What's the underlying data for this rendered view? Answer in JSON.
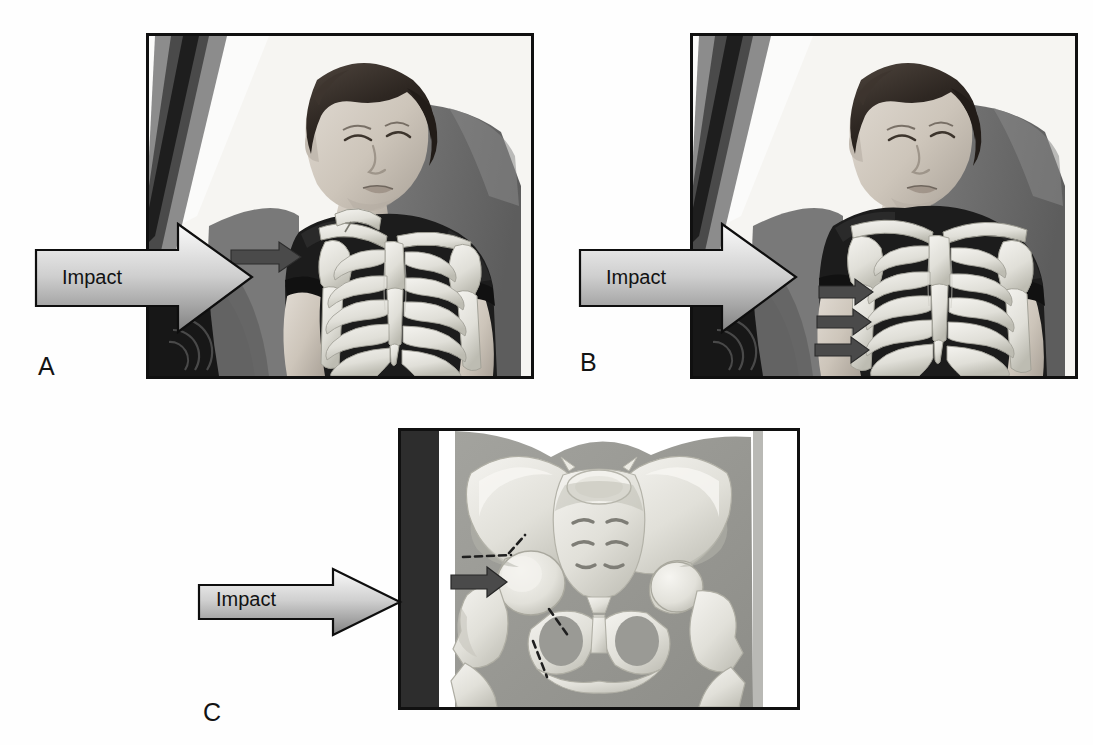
{
  "figure": {
    "background_color": "#fefefe",
    "width": 1093,
    "height": 745
  },
  "panels": [
    {
      "id": "A",
      "letter": "A",
      "letter_x": 38,
      "letter_y": 352,
      "frame": {
        "x": 146,
        "y": 33,
        "width": 388,
        "height": 346
      },
      "scene": "seated-occupant-lateral-impact-clavicle-fracture",
      "impact_label": "Impact",
      "impact_label_x": 62,
      "impact_label_y": 252,
      "arrow": {
        "x": 30,
        "y": 216,
        "width": 225,
        "height": 125
      },
      "injury_arrows": 1,
      "injury_description": "fractured-clavicle"
    },
    {
      "id": "B",
      "letter": "B",
      "letter_x": 580,
      "letter_y": 348,
      "frame": {
        "x": 690,
        "y": 33,
        "width": 388,
        "height": 346
      },
      "scene": "seated-occupant-lateral-impact-rib-fractures",
      "impact_label": "Impact",
      "impact_label_x": 606,
      "impact_label_y": 252,
      "arrow": {
        "x": 574,
        "y": 216,
        "width": 225,
        "height": 125
      },
      "injury_arrows": 3,
      "injury_description": "fractured-ribs"
    },
    {
      "id": "C",
      "letter": "C",
      "letter_x": 203,
      "letter_y": 700,
      "frame": {
        "x": 398,
        "y": 428,
        "width": 402,
        "height": 282
      },
      "scene": "pelvis-anteroposterior-lateral-impact-acetabular-femoral-neck-fracture",
      "impact_label": "Impact",
      "impact_label_x": 216,
      "impact_label_y": 588,
      "arrow": {
        "x": 195,
        "y": 565,
        "width": 207,
        "height": 72
      },
      "injury_arrows": 1,
      "injury_description": "femoral-head-driven-into-acetabulum"
    }
  ],
  "colors": {
    "frame_stroke": "#101010",
    "arrow_stroke": "#0e0e0e",
    "arrow_fill_light": "#f2f2f2",
    "arrow_fill_dark": "#8c8c8c",
    "injury_arrow_fill": "#4a4a4a",
    "bone_light": "#ededea",
    "bone_mid": "#d2d2cc",
    "bone_shadow": "#b6b6ae",
    "shirt_dark": "#1b1b1b",
    "skin_light": "#d8d2ca",
    "skin_mid": "#bdb5ab",
    "hair_dark": "#2a2522",
    "seat_gray": "#6f6f6f",
    "car_pillar": "#3a3a3a",
    "pelvis_soft_tissue": "#9a9a96",
    "door_bar": "#2d2d2d",
    "panel_bg": "#f4f4f2"
  }
}
